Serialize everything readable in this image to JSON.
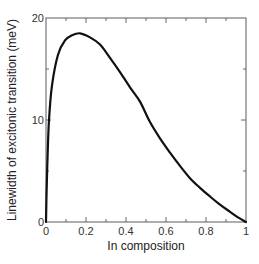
{
  "chart_data": {
    "type": "line",
    "title": "",
    "xlabel": "In composition",
    "ylabel": "Linewidth of excitonic transition (meV)",
    "xlim": [
      0,
      1
    ],
    "ylim": [
      0,
      20
    ],
    "x_major_ticks": [
      0,
      0.2,
      0.4,
      0.6,
      0.8,
      1
    ],
    "x_tick_labels": [
      "0",
      "0.2",
      "0.4",
      "0.6",
      "0.8",
      "1"
    ],
    "x_minor_step": 0.1,
    "y_major_ticks": [
      0,
      10,
      20
    ],
    "y_tick_labels": [
      "0",
      "10",
      "20"
    ],
    "y_minor_step": 5,
    "grid": false,
    "legend": "none",
    "series": [
      {
        "name": "linewidth",
        "color": "#111111",
        "x": [
          0,
          0.003,
          0.008,
          0.015,
          0.03,
          0.06,
          0.095,
          0.13,
          0.17,
          0.22,
          0.27,
          0.32,
          0.37,
          0.42,
          0.47,
          0.52,
          0.57,
          0.62,
          0.67,
          0.72,
          0.77,
          0.82,
          0.87,
          0.92,
          0.96,
          1.0
        ],
        "y": [
          0,
          3.0,
          6.5,
          10.0,
          13.4,
          16.4,
          17.8,
          18.3,
          18.5,
          18.1,
          17.4,
          16.1,
          14.7,
          13.2,
          11.8,
          9.8,
          8.2,
          6.8,
          5.5,
          4.3,
          3.35,
          2.5,
          1.7,
          1.0,
          0.45,
          0
        ]
      }
    ]
  }
}
